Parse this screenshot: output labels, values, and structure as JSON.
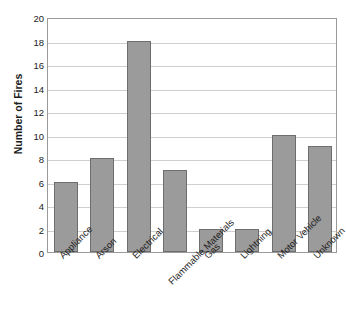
{
  "chart_data": {
    "type": "bar",
    "title": "Causes of Fires in Boomtown",
    "xlabel": "",
    "ylabel": "Number of Fires",
    "categories": [
      "Appliance",
      "Arson",
      "Electrical",
      "Flammable Materials",
      "Gas",
      "Lightning",
      "Motor Vehicle",
      "Unknown"
    ],
    "values": [
      6,
      8,
      18,
      7,
      2,
      2,
      10,
      9
    ],
    "ylim": [
      0,
      20
    ],
    "ytick_step": 2,
    "yticks": [
      20,
      18,
      16,
      14,
      12,
      10,
      8,
      6,
      4,
      2,
      0
    ],
    "grid": true,
    "legend": false,
    "legend_position": "none",
    "bar_color": "#9b9b9b",
    "bar_edge_color": "#6e6e6e",
    "gridline_color": "#cfcfcf",
    "frame_color": "#9a9a9a",
    "background_color": "#ffffff",
    "xlabel_rotation": -45,
    "staggered_labels": [
      "Flammable Materials"
    ]
  }
}
